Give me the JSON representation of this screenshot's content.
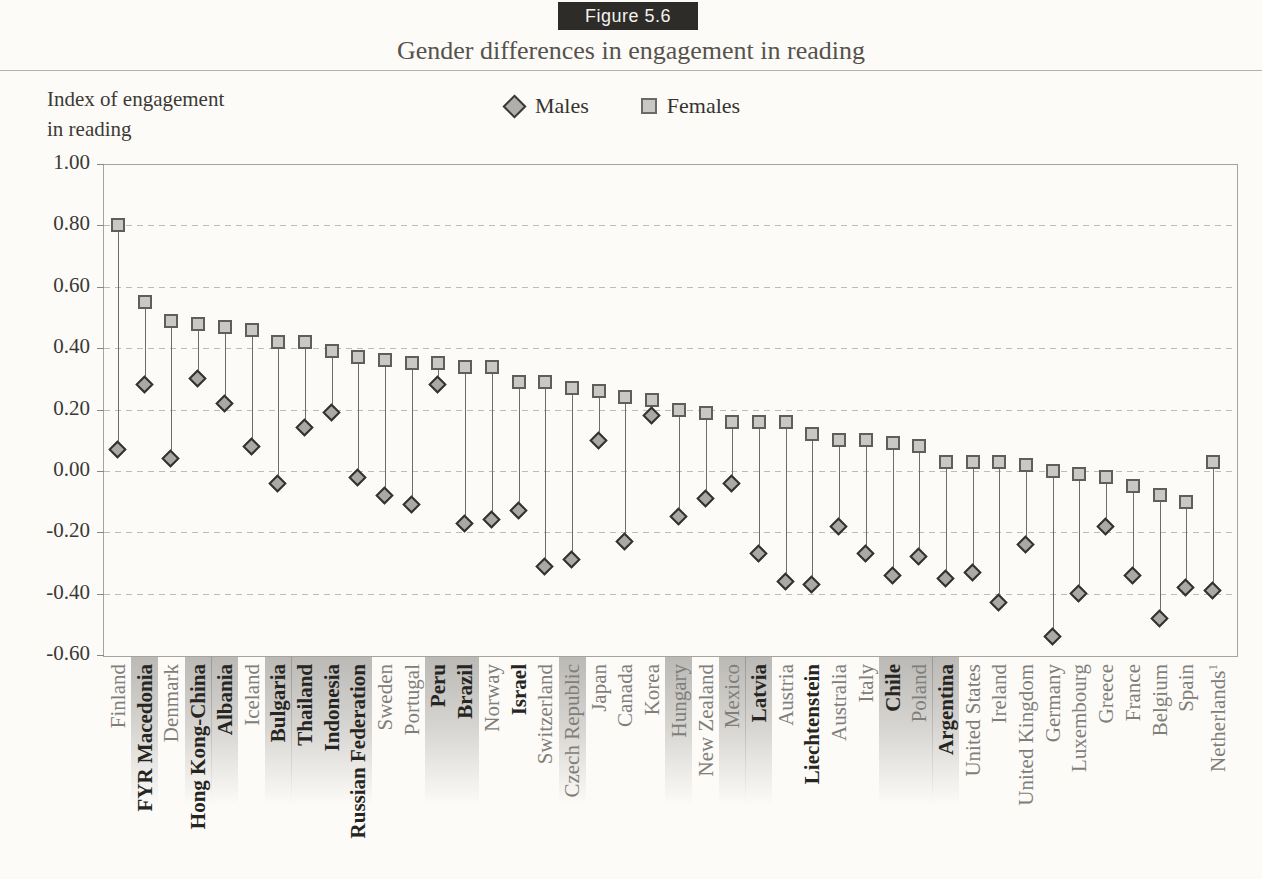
{
  "figure_label": "Figure 5.6",
  "title": "Gender differences in engagement in reading",
  "y_axis_title_line1": "Index of engagement",
  "y_axis_title_line2": "in reading",
  "legend": {
    "males": "Males",
    "females": "Females"
  },
  "colors": {
    "page_background": "#fcfbf8",
    "figure_label_background": "#2d2c29",
    "figure_label_text": "#f4f2ed",
    "title_text": "#56524c",
    "female_square_fill": "#c9c8c4",
    "female_square_border": "#5f5e5a",
    "male_diamond_fill": "#aba9a5",
    "male_diamond_border": "#33322f",
    "gridline": "#bdbbb5",
    "plot_border": "#a5a39d",
    "normal_label": "#817e79",
    "bold_label": "#272521",
    "band_shade": "#7a7874"
  },
  "chart_data": {
    "type": "scatter",
    "title": "Gender differences in engagement in reading",
    "ylabel": "Index of engagement in reading",
    "ylim": [
      -0.6,
      1.0
    ],
    "grid": "dashed horizontal",
    "legend_position": "top-center",
    "y_ticks": [
      {
        "label": "1.00",
        "value": 1.0
      },
      {
        "label": "0.80",
        "value": 0.8
      },
      {
        "label": "0.60",
        "value": 0.6
      },
      {
        "label": "0.40",
        "value": 0.4
      },
      {
        "label": "0.20",
        "value": 0.2
      },
      {
        "label": "0.00",
        "value": 0.0
      },
      {
        "label": "-0.20",
        "value": -0.2
      },
      {
        "label": "-0.40",
        "value": -0.4
      },
      {
        "label": "-0.60",
        "value": -0.6
      }
    ],
    "series": [
      {
        "name": "Males",
        "marker": "diamond"
      },
      {
        "name": "Females",
        "marker": "square"
      }
    ],
    "countries": [
      {
        "name": "Finland",
        "males": 0.07,
        "females": 0.8,
        "bold": false,
        "band": false,
        "sup": ""
      },
      {
        "name": "FYR Macedonia",
        "males": 0.28,
        "females": 0.55,
        "bold": true,
        "band": true,
        "sup": ""
      },
      {
        "name": "Denmark",
        "males": 0.04,
        "females": 0.49,
        "bold": false,
        "band": false,
        "sup": ""
      },
      {
        "name": "Hong Kong-China",
        "males": 0.3,
        "females": 0.48,
        "bold": true,
        "band": true,
        "sup": ""
      },
      {
        "name": "Albania",
        "males": 0.22,
        "females": 0.47,
        "bold": true,
        "band": true,
        "sup": ""
      },
      {
        "name": "Iceland",
        "males": 0.08,
        "females": 0.46,
        "bold": false,
        "band": false,
        "sup": ""
      },
      {
        "name": "Bulgaria",
        "males": -0.04,
        "females": 0.42,
        "bold": true,
        "band": true,
        "sup": ""
      },
      {
        "name": "Thailand",
        "males": 0.14,
        "females": 0.42,
        "bold": true,
        "band": true,
        "sup": ""
      },
      {
        "name": "Indonesia",
        "males": 0.19,
        "females": 0.39,
        "bold": true,
        "band": true,
        "sup": ""
      },
      {
        "name": "Russian Federation",
        "males": -0.02,
        "females": 0.37,
        "bold": true,
        "band": true,
        "sup": ""
      },
      {
        "name": "Sweden",
        "males": -0.08,
        "females": 0.36,
        "bold": false,
        "band": false,
        "sup": ""
      },
      {
        "name": "Portugal",
        "males": -0.11,
        "females": 0.35,
        "bold": false,
        "band": false,
        "sup": ""
      },
      {
        "name": "Peru",
        "males": 0.28,
        "females": 0.35,
        "bold": true,
        "band": true,
        "sup": ""
      },
      {
        "name": "Brazil",
        "males": -0.17,
        "females": 0.34,
        "bold": true,
        "band": true,
        "sup": ""
      },
      {
        "name": "Norway",
        "males": -0.16,
        "females": 0.34,
        "bold": false,
        "band": false,
        "sup": ""
      },
      {
        "name": "Israel",
        "males": -0.13,
        "females": 0.29,
        "bold": true,
        "band": false,
        "sup": ""
      },
      {
        "name": "Switzerland",
        "males": -0.31,
        "females": 0.29,
        "bold": false,
        "band": false,
        "sup": ""
      },
      {
        "name": "Czech Republic",
        "males": -0.29,
        "females": 0.27,
        "bold": false,
        "band": true,
        "sup": ""
      },
      {
        "name": "Japan",
        "males": 0.1,
        "females": 0.26,
        "bold": false,
        "band": false,
        "sup": ""
      },
      {
        "name": "Canada",
        "males": -0.23,
        "females": 0.24,
        "bold": false,
        "band": false,
        "sup": ""
      },
      {
        "name": "Korea",
        "males": 0.18,
        "females": 0.23,
        "bold": false,
        "band": false,
        "sup": ""
      },
      {
        "name": "Hungary",
        "males": -0.15,
        "females": 0.2,
        "bold": false,
        "band": true,
        "sup": ""
      },
      {
        "name": "New Zealand",
        "males": -0.09,
        "females": 0.19,
        "bold": false,
        "band": false,
        "sup": ""
      },
      {
        "name": "Mexico",
        "males": -0.04,
        "females": 0.16,
        "bold": false,
        "band": true,
        "sup": ""
      },
      {
        "name": "Latvia",
        "males": -0.27,
        "females": 0.16,
        "bold": true,
        "band": true,
        "sup": ""
      },
      {
        "name": "Austria",
        "males": -0.36,
        "females": 0.16,
        "bold": false,
        "band": false,
        "sup": ""
      },
      {
        "name": "Liechtenstein",
        "males": -0.37,
        "females": 0.12,
        "bold": true,
        "band": false,
        "sup": ""
      },
      {
        "name": "Australia",
        "males": -0.18,
        "females": 0.1,
        "bold": false,
        "band": false,
        "sup": ""
      },
      {
        "name": "Italy",
        "males": -0.27,
        "females": 0.1,
        "bold": false,
        "band": false,
        "sup": ""
      },
      {
        "name": "Chile",
        "males": -0.34,
        "females": 0.09,
        "bold": true,
        "band": true,
        "sup": ""
      },
      {
        "name": "Poland",
        "males": -0.28,
        "females": 0.08,
        "bold": false,
        "band": true,
        "sup": ""
      },
      {
        "name": "Argentina",
        "males": -0.35,
        "females": 0.03,
        "bold": true,
        "band": true,
        "sup": ""
      },
      {
        "name": "United States",
        "males": -0.33,
        "females": 0.03,
        "bold": false,
        "band": false,
        "sup": ""
      },
      {
        "name": "Ireland",
        "males": -0.43,
        "females": 0.03,
        "bold": false,
        "band": false,
        "sup": ""
      },
      {
        "name": "United Kingdom",
        "males": -0.24,
        "females": 0.02,
        "bold": false,
        "band": false,
        "sup": ""
      },
      {
        "name": "Germany",
        "males": -0.54,
        "females": 0.0,
        "bold": false,
        "band": false,
        "sup": ""
      },
      {
        "name": "Luxembourg",
        "males": -0.4,
        "females": -0.01,
        "bold": false,
        "band": false,
        "sup": ""
      },
      {
        "name": "Greece",
        "males": -0.18,
        "females": -0.02,
        "bold": false,
        "band": false,
        "sup": ""
      },
      {
        "name": "France",
        "males": -0.34,
        "females": -0.05,
        "bold": false,
        "band": false,
        "sup": ""
      },
      {
        "name": "Belgium",
        "males": -0.48,
        "females": -0.08,
        "bold": false,
        "band": false,
        "sup": ""
      },
      {
        "name": "Spain",
        "males": -0.38,
        "females": -0.1,
        "bold": false,
        "band": false,
        "sup": ""
      },
      {
        "name": "Netherlands",
        "males": -0.39,
        "females": 0.03,
        "bold": false,
        "band": false,
        "sup": "1"
      }
    ]
  }
}
